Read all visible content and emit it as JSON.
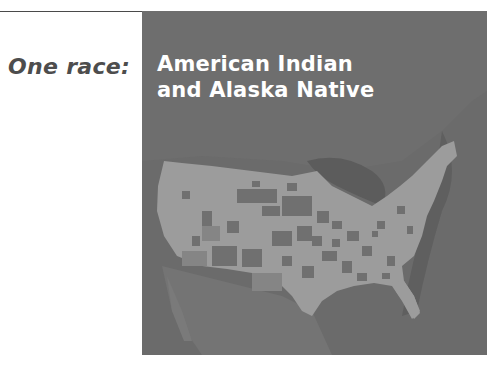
{
  "header": {
    "label": "One race:"
  },
  "map": {
    "title_line1": "American Indian",
    "title_line2": "and Alaska Native",
    "colors": {
      "background": "#6b6b6b",
      "land_light": "#9c9c9c",
      "land_dark": "#707070",
      "water_shadow": "#5a5a5a",
      "title_text": "#ffffff",
      "label_text": "#4d4d4d"
    }
  }
}
